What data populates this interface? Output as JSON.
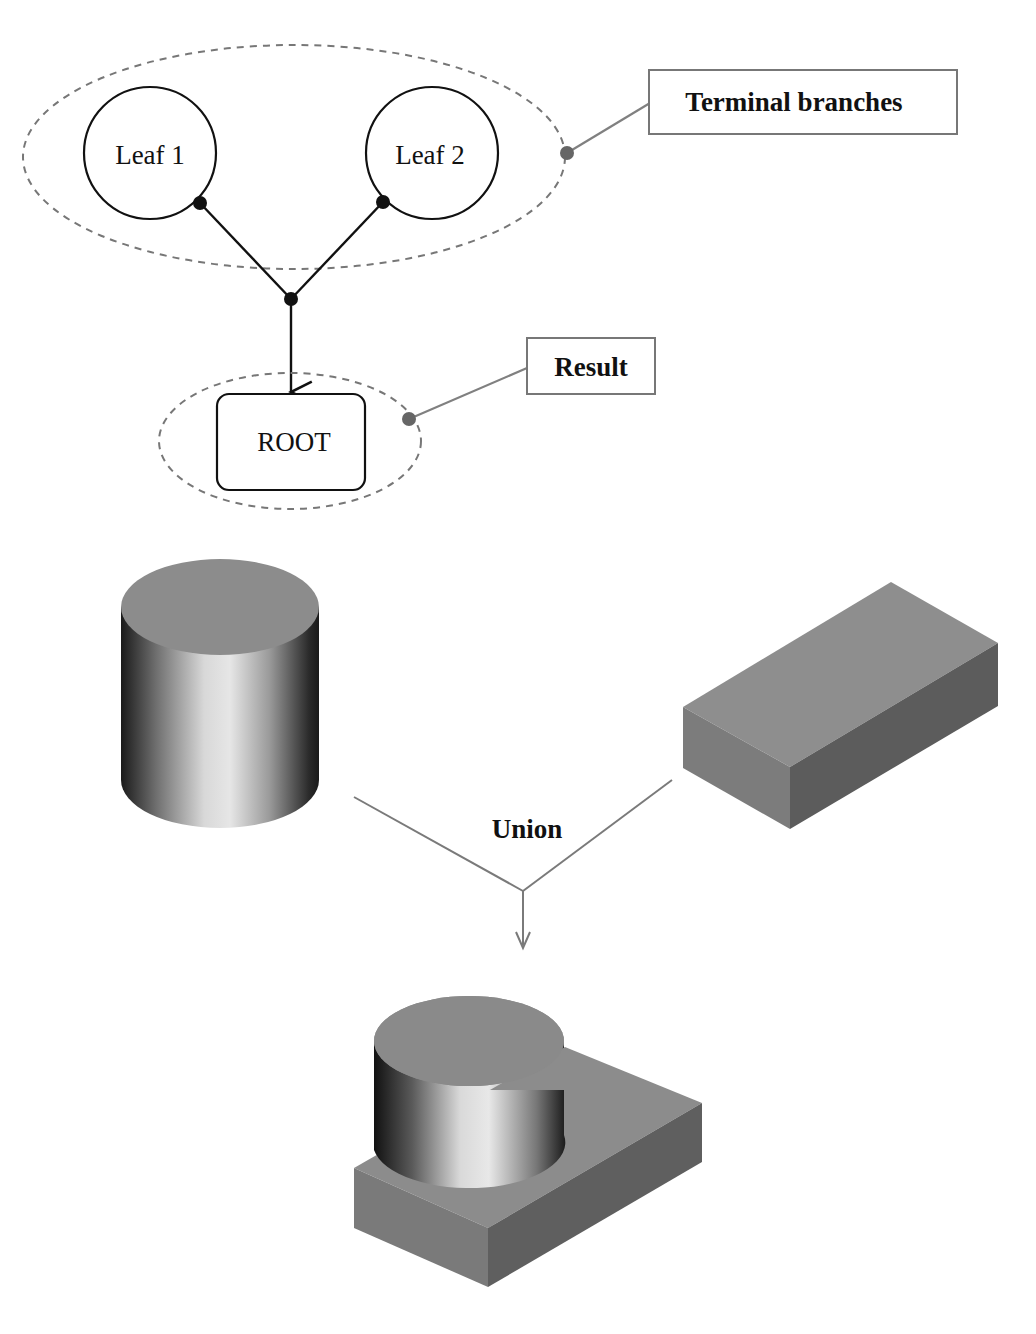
{
  "diagram": {
    "type": "csg-tree-and-union",
    "tree": {
      "leaves": [
        {
          "id": "leaf1",
          "label": "Leaf 1"
        },
        {
          "id": "leaf2",
          "label": "Leaf 2"
        }
      ],
      "root": {
        "label": "ROOT"
      },
      "callouts": {
        "terminal_branches": "Terminal branches",
        "result": "Result"
      }
    },
    "operation": {
      "label": "Union",
      "inputs": [
        "cylinder",
        "box"
      ],
      "output": "cylinder-box-union"
    },
    "colors": {
      "line": "#111111",
      "dashed_group": "#777777",
      "callout_line": "#808080",
      "callout_dot": "#666666",
      "solid_top": "#8a8a8a",
      "box_front": "#7a7a7a",
      "box_side": "#5e5e5e"
    }
  }
}
